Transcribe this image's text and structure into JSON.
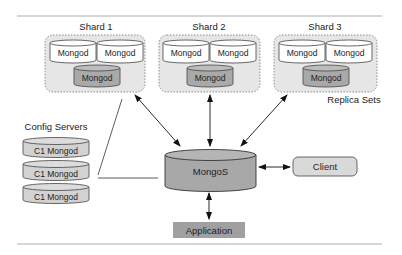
{
  "diagram": {
    "title_rule": true,
    "shards": [
      {
        "label": "Shard 1",
        "nodes": [
          "Mongod",
          "Mongod",
          "Mongod"
        ]
      },
      {
        "label": "Shard 2",
        "nodes": [
          "Mongod",
          "Mongod",
          "Mongod"
        ]
      },
      {
        "label": "Shard 3",
        "nodes": [
          "Mongod",
          "Mongod",
          "Mongod"
        ]
      }
    ],
    "replica_sets_label": "Replica Sets",
    "config_servers": {
      "label": "Config Servers",
      "nodes": [
        "C1 Mongod",
        "C1 Mongod",
        "C1 Mongod"
      ]
    },
    "router": "MongoS",
    "client": "Client",
    "application": "Application",
    "colors": {
      "shard_fill": "#e6e6e6",
      "primary_cylinder": "#a9a9a9",
      "secondary_cylinder": "#ffffff",
      "config_cylinder": "#d2d2d2",
      "mongos_fill": "#a8a8a8",
      "client_fill": "#d9d9d9",
      "application_fill": "#a0a0a0",
      "rule": "#c8c8c8"
    }
  }
}
